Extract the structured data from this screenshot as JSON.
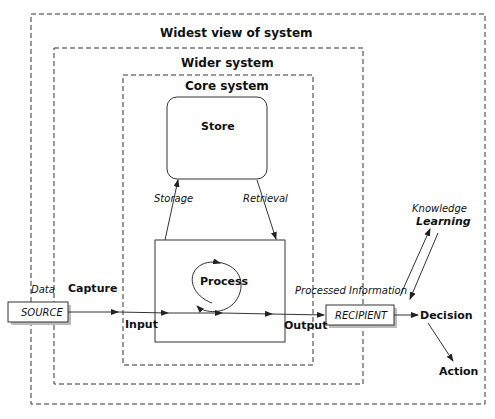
{
  "boundaries": {
    "widest": "Widest view of system",
    "wider": "Wider system",
    "core": "Core system"
  },
  "nodes": {
    "store": "Store",
    "process": "Process",
    "source": "SOURCE",
    "recipient": "RECIPIENT"
  },
  "labels": {
    "data": "Data",
    "capture": "Capture",
    "input": "Input",
    "output": "Output",
    "storage": "Storage",
    "retrieval": "Retrieval",
    "processed_information": "Processed Information",
    "knowledge": "Knowledge",
    "learning": "Learning",
    "decision": "Decision",
    "action": "Action"
  }
}
